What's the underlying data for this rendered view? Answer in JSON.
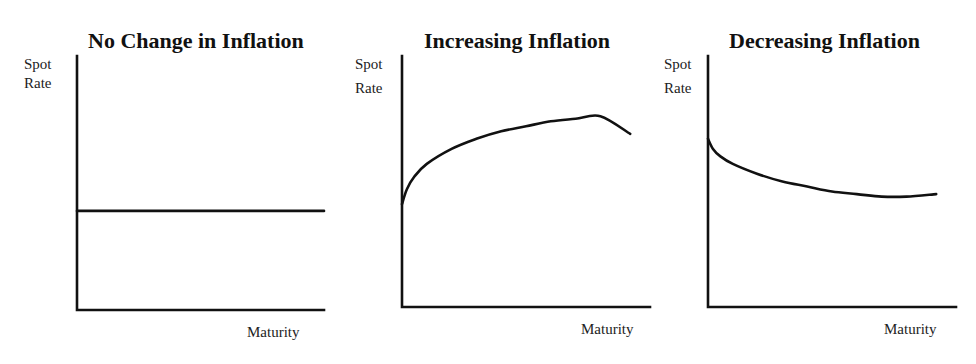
{
  "chart_data": [
    {
      "type": "line",
      "title": "No Change in Inflation",
      "xlabel": "Maturity",
      "ylabel_lines": [
        "Spot",
        "Rate"
      ],
      "xlim": [
        0,
        1
      ],
      "ylim": [
        0,
        1
      ],
      "grid": false,
      "series": [
        {
          "name": "Spot rate curve",
          "shape": "flat",
          "x": [
            0,
            0.25,
            0.5,
            0.75,
            1.0
          ],
          "y": [
            0.39,
            0.39,
            0.39,
            0.39,
            0.39
          ]
        }
      ]
    },
    {
      "type": "line",
      "title": "Increasing Inflation",
      "xlabel": "Maturity",
      "ylabel_lines": [
        "Spot",
        "Rate"
      ],
      "xlim": [
        0,
        1
      ],
      "ylim": [
        0,
        1
      ],
      "grid": false,
      "series": [
        {
          "name": "Spot rate curve",
          "shape": "rising-concave",
          "x": [
            0,
            0.02,
            0.05,
            0.1,
            0.2,
            0.3,
            0.4,
            0.5,
            0.6,
            0.7,
            0.8,
            0.92
          ],
          "y": [
            0.41,
            0.47,
            0.52,
            0.57,
            0.63,
            0.67,
            0.7,
            0.72,
            0.74,
            0.75,
            0.76,
            0.69
          ]
        }
      ]
    },
    {
      "type": "line",
      "title": "Decreasing Inflation",
      "xlabel": "Maturity",
      "ylabel_lines": [
        "Spot",
        "Rate"
      ],
      "xlim": [
        0,
        1
      ],
      "ylim": [
        0,
        1
      ],
      "grid": false,
      "series": [
        {
          "name": "Spot rate curve",
          "shape": "falling-convex",
          "x": [
            0,
            0.02,
            0.05,
            0.1,
            0.2,
            0.3,
            0.4,
            0.5,
            0.6,
            0.7,
            0.8,
            0.92
          ],
          "y": [
            0.67,
            0.63,
            0.6,
            0.57,
            0.53,
            0.5,
            0.48,
            0.46,
            0.45,
            0.44,
            0.44,
            0.45
          ]
        }
      ]
    }
  ]
}
